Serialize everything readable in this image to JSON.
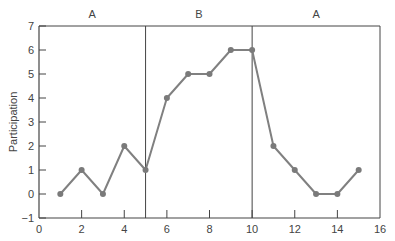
{
  "chart_data": {
    "type": "line",
    "title": "",
    "xlabel": "",
    "ylabel": "Participation",
    "xlim": [
      0,
      16
    ],
    "ylim": [
      -1,
      7
    ],
    "x_ticks": [
      0,
      2,
      4,
      6,
      8,
      10,
      12,
      14,
      16
    ],
    "y_ticks": [
      -1,
      0,
      1,
      2,
      3,
      4,
      5,
      6,
      7
    ],
    "grid": false,
    "phases": [
      {
        "label": "A",
        "start": 0,
        "end": 5
      },
      {
        "label": "B",
        "start": 5,
        "end": 10
      },
      {
        "label": "A",
        "start": 10,
        "end": 16
      }
    ],
    "phase_dividers": [
      5,
      10
    ],
    "series": [
      {
        "name": "Participation",
        "x": [
          1,
          2,
          3,
          4,
          5,
          6,
          7,
          8,
          9,
          10,
          11,
          12,
          13,
          14,
          15
        ],
        "values": [
          0,
          1,
          0,
          2,
          1,
          4,
          5,
          5,
          6,
          6,
          2,
          1,
          0,
          0,
          1
        ],
        "color": "#808080"
      }
    ]
  },
  "colors": {
    "axis": "#444444",
    "line": "#808080",
    "marker": "#7a7a7a"
  }
}
